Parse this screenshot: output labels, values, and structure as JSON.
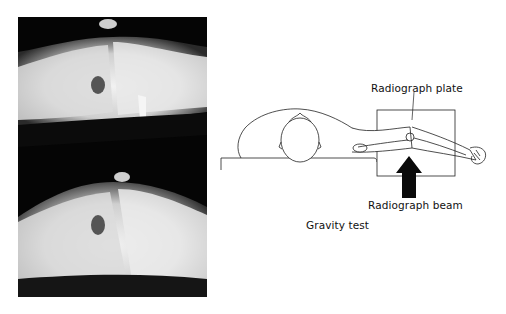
{
  "figure": {
    "left_panel": {
      "type": "radiograph-pair",
      "description": "Two lateral knee radiographs stacked vertically"
    },
    "right_panel": {
      "labels": {
        "plate": "Radiograph plate",
        "beam": "Radiograph beam"
      },
      "caption": "Gravity test"
    }
  }
}
